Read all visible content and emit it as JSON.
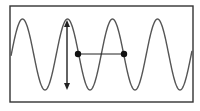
{
  "diagram": {
    "type": "sine-wave-wavelength-amplitude",
    "colors": {
      "frame": "#333333",
      "wave": "#555555",
      "annotation": "#222222",
      "background": "#ffffff"
    },
    "frame": {
      "x": 10,
      "y": 6,
      "width": 183,
      "height": 96
    },
    "wave": {
      "center_y": 54.5,
      "amplitude": 35.5,
      "period": 45,
      "first_peak_x": 22.5,
      "x_start": 11,
      "x_end": 192
    },
    "amplitude_arrow": {
      "x": 67,
      "y_top": 20,
      "y_bottom": 90
    },
    "wavelength_marker": {
      "y": 54,
      "points": [
        {
          "x": 78,
          "y": 54
        },
        {
          "x": 124,
          "y": 54
        }
      ]
    }
  }
}
